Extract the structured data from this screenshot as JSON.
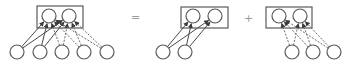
{
  "diagram": {
    "operators": {
      "equals": "=",
      "plus": "+"
    },
    "colors": {
      "stroke": "#5a5a5a",
      "operator": "#9a9a9a",
      "background": "#ffffff"
    },
    "panels": [
      {
        "name": "combined",
        "box": {
          "x": 37,
          "y": 6,
          "w": 46,
          "h": 22
        },
        "top_nodes": [
          {
            "cx": 49,
            "cy": 16
          },
          {
            "cx": 69,
            "cy": 16
          }
        ],
        "bottom_nodes": [
          {
            "cx": 17,
            "cy": 52
          },
          {
            "cx": 40,
            "cy": 52
          },
          {
            "cx": 62,
            "cy": 52
          },
          {
            "cx": 84,
            "cy": 52
          },
          {
            "cx": 107,
            "cy": 52
          }
        ],
        "solid_edges": [
          [
            0,
            0
          ],
          [
            0,
            1
          ],
          [
            1,
            0
          ],
          [
            1,
            1
          ]
        ],
        "dashed_edges": [
          [
            2,
            0
          ],
          [
            2,
            1
          ],
          [
            3,
            0
          ],
          [
            3,
            1
          ],
          [
            4,
            0
          ],
          [
            4,
            1
          ]
        ]
      },
      {
        "name": "solid-part",
        "box": {
          "x": 181,
          "y": 7,
          "w": 47,
          "h": 21
        },
        "top_nodes": [
          {
            "cx": 193,
            "cy": 16
          },
          {
            "cx": 215,
            "cy": 16
          }
        ],
        "bottom_nodes": [
          {
            "cx": 163,
            "cy": 52
          },
          {
            "cx": 185,
            "cy": 52
          }
        ],
        "solid_edges": [
          [
            0,
            0
          ],
          [
            0,
            1
          ],
          [
            1,
            0
          ],
          [
            1,
            1
          ]
        ],
        "dashed_edges": []
      },
      {
        "name": "dashed-part",
        "box": {
          "x": 266,
          "y": 7,
          "w": 46,
          "h": 21
        },
        "top_nodes": [
          {
            "cx": 279,
            "cy": 16
          },
          {
            "cx": 300,
            "cy": 16
          }
        ],
        "bottom_nodes": [
          {
            "cx": 292,
            "cy": 52
          },
          {
            "cx": 313,
            "cy": 52
          },
          {
            "cx": 334,
            "cy": 52
          }
        ],
        "solid_edges": [],
        "dashed_edges": [
          [
            0,
            0
          ],
          [
            0,
            1
          ],
          [
            1,
            0
          ],
          [
            1,
            1
          ],
          [
            2,
            0
          ],
          [
            2,
            1
          ]
        ]
      }
    ]
  }
}
